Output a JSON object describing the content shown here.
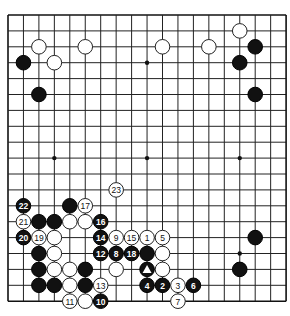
{
  "board": {
    "size": 19,
    "origin_x": 8,
    "origin_y": 15,
    "spacing_x": 15.45,
    "spacing_y": 15.9,
    "stone_radius": 7.3,
    "colors": {
      "black": "#111111",
      "white": "#ffffff",
      "line": "#222222"
    },
    "hoshi": [
      [
        3,
        3
      ],
      [
        9,
        3
      ],
      [
        15,
        3
      ],
      [
        3,
        9
      ],
      [
        9,
        9
      ],
      [
        15,
        9
      ],
      [
        3,
        15
      ],
      [
        9,
        15
      ],
      [
        15,
        15
      ]
    ]
  },
  "stones": [
    {
      "col": 2,
      "row": 2,
      "color": "white",
      "label": ""
    },
    {
      "col": 5,
      "row": 2,
      "color": "white",
      "label": ""
    },
    {
      "col": 1,
      "row": 3,
      "color": "black",
      "label": ""
    },
    {
      "col": 3,
      "row": 3,
      "color": "white",
      "label": ""
    },
    {
      "col": 2,
      "row": 5,
      "color": "black",
      "label": ""
    },
    {
      "col": 10,
      "row": 2,
      "color": "white",
      "label": ""
    },
    {
      "col": 13,
      "row": 2,
      "color": "white",
      "label": ""
    },
    {
      "col": 15,
      "row": 1,
      "color": "white",
      "label": ""
    },
    {
      "col": 16,
      "row": 2,
      "color": "black",
      "label": ""
    },
    {
      "col": 15,
      "row": 3,
      "color": "black",
      "label": ""
    },
    {
      "col": 16,
      "row": 5,
      "color": "black",
      "label": ""
    },
    {
      "col": 16,
      "row": 14,
      "color": "black",
      "label": ""
    },
    {
      "col": 15,
      "row": 16,
      "color": "black",
      "label": ""
    },
    {
      "col": 7,
      "row": 11,
      "color": "white",
      "label": "23"
    },
    {
      "col": 1,
      "row": 12,
      "color": "black",
      "label": "22"
    },
    {
      "col": 4,
      "row": 12,
      "color": "black",
      "label": ""
    },
    {
      "col": 5,
      "row": 12,
      "color": "white",
      "label": "17"
    },
    {
      "col": 1,
      "row": 13,
      "color": "white",
      "label": "21"
    },
    {
      "col": 2,
      "row": 13,
      "color": "black",
      "label": ""
    },
    {
      "col": 3,
      "row": 13,
      "color": "black",
      "label": ""
    },
    {
      "col": 4,
      "row": 13,
      "color": "white",
      "label": ""
    },
    {
      "col": 5,
      "row": 13,
      "color": "white",
      "label": ""
    },
    {
      "col": 6,
      "row": 13,
      "color": "black",
      "label": "16"
    },
    {
      "col": 1,
      "row": 14,
      "color": "black",
      "label": "20"
    },
    {
      "col": 2,
      "row": 14,
      "color": "white",
      "label": "19"
    },
    {
      "col": 3,
      "row": 14,
      "color": "white",
      "label": ""
    },
    {
      "col": 6,
      "row": 14,
      "color": "black",
      "label": "14"
    },
    {
      "col": 7,
      "row": 14,
      "color": "white",
      "label": "9"
    },
    {
      "col": 8,
      "row": 14,
      "color": "white",
      "label": "15"
    },
    {
      "col": 9,
      "row": 14,
      "color": "white",
      "label": "1"
    },
    {
      "col": 10,
      "row": 14,
      "color": "white",
      "label": "5"
    },
    {
      "col": 2,
      "row": 15,
      "color": "black",
      "label": ""
    },
    {
      "col": 3,
      "row": 15,
      "color": "white",
      "label": ""
    },
    {
      "col": 6,
      "row": 15,
      "color": "black",
      "label": "12"
    },
    {
      "col": 7,
      "row": 15,
      "color": "black",
      "label": "8"
    },
    {
      "col": 8,
      "row": 15,
      "color": "black",
      "label": "18"
    },
    {
      "col": 9,
      "row": 15,
      "color": "black",
      "label": ""
    },
    {
      "col": 10,
      "row": 15,
      "color": "white",
      "label": ""
    },
    {
      "col": 2,
      "row": 16,
      "color": "black",
      "label": ""
    },
    {
      "col": 3,
      "row": 16,
      "color": "white",
      "label": ""
    },
    {
      "col": 4,
      "row": 16,
      "color": "white",
      "label": ""
    },
    {
      "col": 5,
      "row": 16,
      "color": "black",
      "label": ""
    },
    {
      "col": 7,
      "row": 16,
      "color": "white",
      "label": ""
    },
    {
      "col": 9,
      "row": 16,
      "color": "black",
      "label": "",
      "marker": "triangle"
    },
    {
      "col": 10,
      "row": 16,
      "color": "white",
      "label": ""
    },
    {
      "col": 2,
      "row": 17,
      "color": "black",
      "label": ""
    },
    {
      "col": 3,
      "row": 17,
      "color": "black",
      "label": ""
    },
    {
      "col": 4,
      "row": 17,
      "color": "white",
      "label": ""
    },
    {
      "col": 5,
      "row": 17,
      "color": "black",
      "label": ""
    },
    {
      "col": 6,
      "row": 17,
      "color": "white",
      "label": "13"
    },
    {
      "col": 9,
      "row": 17,
      "color": "black",
      "label": "4"
    },
    {
      "col": 10,
      "row": 17,
      "color": "black",
      "label": "2"
    },
    {
      "col": 11,
      "row": 17,
      "color": "white",
      "label": "3"
    },
    {
      "col": 12,
      "row": 17,
      "color": "black",
      "label": "6"
    },
    {
      "col": 4,
      "row": 18,
      "color": "white",
      "label": "11"
    },
    {
      "col": 5,
      "row": 18,
      "color": "white",
      "label": ""
    },
    {
      "col": 6,
      "row": 18,
      "color": "black",
      "label": "10"
    },
    {
      "col": 11,
      "row": 18,
      "color": "white",
      "label": "7"
    }
  ]
}
